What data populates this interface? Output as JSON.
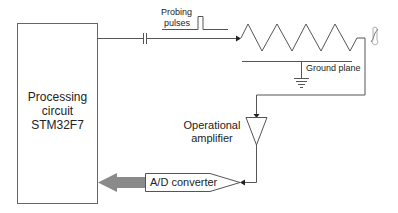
{
  "diagram": {
    "processing_block": {
      "lines": [
        "Processing",
        "circuit",
        "STM32F7"
      ]
    },
    "probing_pulses": {
      "lines": [
        "Probing",
        "pulses"
      ]
    },
    "ground_plane_label": "Ground plane",
    "op_amp": {
      "lines": [
        "Operational",
        "amplifier"
      ]
    },
    "adc_label": "A/D converter",
    "colors": {
      "line": "#555555",
      "arrow_fill": "#8a8a8a",
      "box_border": "#666666"
    }
  }
}
